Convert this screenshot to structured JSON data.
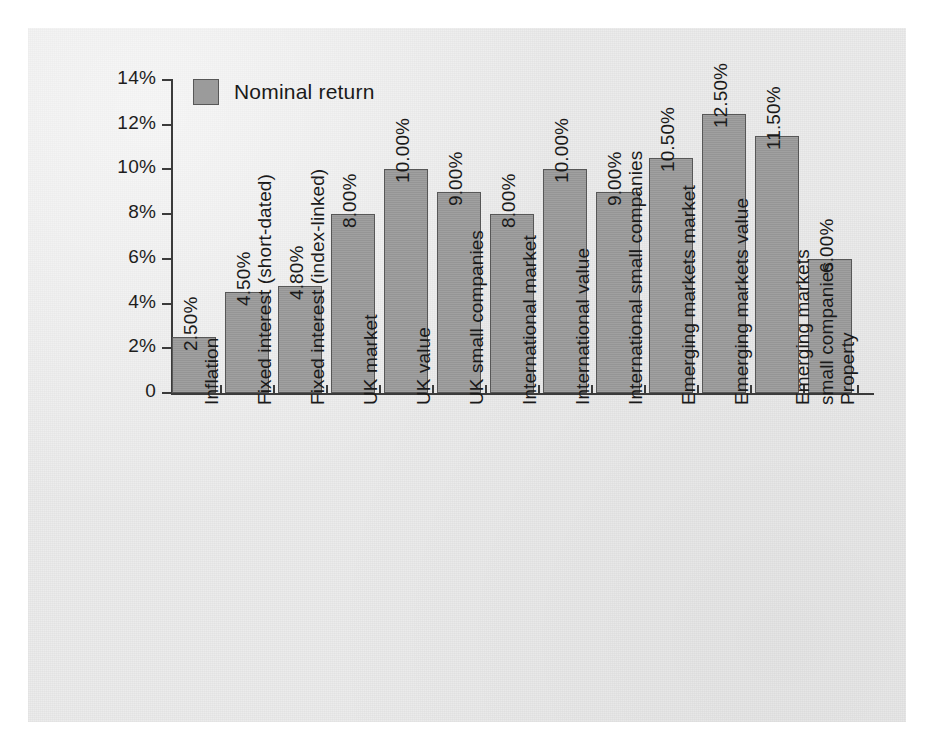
{
  "chart_data": {
    "type": "bar",
    "title": "",
    "xlabel": "",
    "ylabel": "",
    "ylim": [
      0,
      14
    ],
    "grid": false,
    "legend_position": "top-left",
    "value_label_format": "percent-2dp",
    "series": [
      {
        "name": "Nominal return",
        "color": "#9b9b9b",
        "values": [
          2.5,
          4.5,
          4.8,
          8.0,
          10.0,
          9.0,
          8.0,
          10.0,
          9.0,
          10.5,
          12.5,
          11.5,
          6.0
        ]
      }
    ],
    "categories": [
      "Inflation",
      "Fixed interest (short-dated)",
      "Fixed interest (index-linked)",
      "UK market",
      "UK value",
      "UK small companies",
      "International market",
      "International value",
      "International small companies",
      "Emerging markets market",
      "Emerging markets value",
      "Emerging markets small companies",
      "Property"
    ],
    "category_lines": [
      [
        "Inflation"
      ],
      [
        "Fixed interest (short-dated)"
      ],
      [
        "Fixed interest (index-linked)"
      ],
      [
        "UK market"
      ],
      [
        "UK value"
      ],
      [
        "UK small companies"
      ],
      [
        "International market"
      ],
      [
        "International value"
      ],
      [
        "International small companies"
      ],
      [
        "Emerging markets market"
      ],
      [
        "Emerging markets value"
      ],
      [
        "Emerging markets",
        "small companies"
      ],
      [
        "Property"
      ]
    ],
    "value_labels": [
      "2.50%",
      "4.50%",
      "4.80%",
      "8.00%",
      "10.00%",
      "9.00%",
      "8.00%",
      "10.00%",
      "9.00%",
      "10.50%",
      "12.50%",
      "11.50%",
      "6.00%"
    ],
    "y_ticks": [
      0,
      2,
      4,
      6,
      8,
      10,
      12,
      14
    ],
    "y_tick_labels": [
      "0",
      "2%",
      "4%",
      "6%",
      "8%",
      "10%",
      "12%",
      "14%"
    ]
  },
  "legend": {
    "swatch_name": "legend-swatch",
    "label": "Nominal return",
    "color": "#9b9b9b"
  },
  "colors": {
    "bar_fill": "#9b9b9b",
    "bar_border": "#575757",
    "axis": "#3b3b3b",
    "text": "#1a1a1a",
    "panel_background": "#ececec",
    "page_background": "#ffffff"
  }
}
